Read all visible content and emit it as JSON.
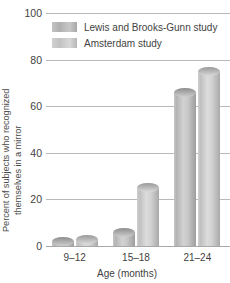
{
  "chart_data": {
    "type": "bar",
    "title": "",
    "categories": [
      "9–12",
      "15–18",
      "21–24"
    ],
    "series": [
      {
        "name": "Lewis and Brooks-Gunn study",
        "values": [
          2,
          6,
          66
        ],
        "color": "#b4b4b4"
      },
      {
        "name": "Amsterdam study",
        "values": [
          3,
          25,
          75
        ],
        "color": "#c8c8c8"
      }
    ],
    "xlabel": "Age (months)",
    "ylabel_line1": "Percent of subjects who recognized",
    "ylabel_line2": "themselves in a mirror",
    "yticks": [
      0,
      20,
      40,
      60,
      80,
      100
    ],
    "ylim": [
      0,
      100
    ],
    "grid": true,
    "legend_position": "top-left"
  },
  "legend": {
    "items": [
      {
        "label": "Lewis and Brooks-Gunn study"
      },
      {
        "label": "Amsterdam study"
      }
    ]
  }
}
